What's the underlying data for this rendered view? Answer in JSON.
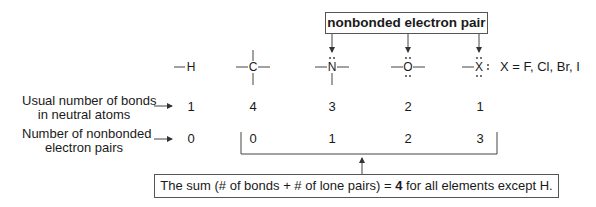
{
  "callout": {
    "label": "nonbonded electron pair"
  },
  "atoms": [
    {
      "symbol": "H",
      "bonds": "1",
      "lone_pairs": "0"
    },
    {
      "symbol": "C",
      "bonds": "4",
      "lone_pairs": "0"
    },
    {
      "symbol": "N",
      "bonds": "3",
      "lone_pairs": "1"
    },
    {
      "symbol": "O",
      "bonds": "2",
      "lone_pairs": "2"
    },
    {
      "symbol": "X",
      "bonds": "1",
      "lone_pairs": "3"
    }
  ],
  "halogen_note": "X = F, Cl, Br, I",
  "rows": {
    "bonds_label_line1": "Usual number of bonds",
    "bonds_label_line2": "in neutral atoms",
    "lone_pairs_label_line1": "Number of nonbonded",
    "lone_pairs_label_line2": "electron pairs"
  },
  "summary": {
    "prefix": "The sum (# of bonds + # of lone pairs) = ",
    "value": "4",
    "suffix": " for all elements except H."
  },
  "colors": {
    "line": "#444444",
    "text": "#1a1a1a",
    "box_border": "#555555"
  }
}
